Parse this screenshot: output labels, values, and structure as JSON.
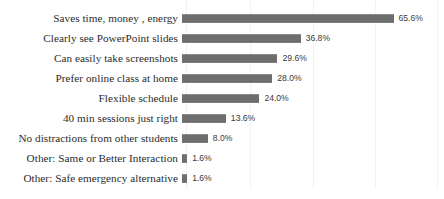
{
  "chart_data": {
    "type": "bar",
    "orientation": "horizontal",
    "title": "",
    "xlabel": "",
    "ylabel": "",
    "xlim": [
      0,
      80
    ],
    "grid": true,
    "gridline_values": [
      20,
      40,
      60,
      80
    ],
    "legend": "none",
    "value_suffix": "%",
    "bar_color": "#6e6e6e",
    "gridline_color": "#f3f3f5",
    "background_color": "#ffffff",
    "categories": [
      "Saves time, money , energy",
      "Clearly see PowerPoint slides",
      "Can easily take screenshots",
      "Prefer online class at home",
      "Flexible schedule",
      "40 min sessions just right",
      "No distractions from other students",
      "Other: Same or Better Interaction",
      "Other: Safe emergency alternative"
    ],
    "values": [
      65.6,
      36.8,
      29.6,
      28.0,
      24.0,
      13.6,
      8.0,
      1.6,
      1.6
    ],
    "data_labels": [
      "65.6%",
      "36.8%",
      "29.6%",
      "28.0%",
      "24.0%",
      "13.6%",
      "8.0%",
      "1.6%",
      "1.6%"
    ]
  }
}
